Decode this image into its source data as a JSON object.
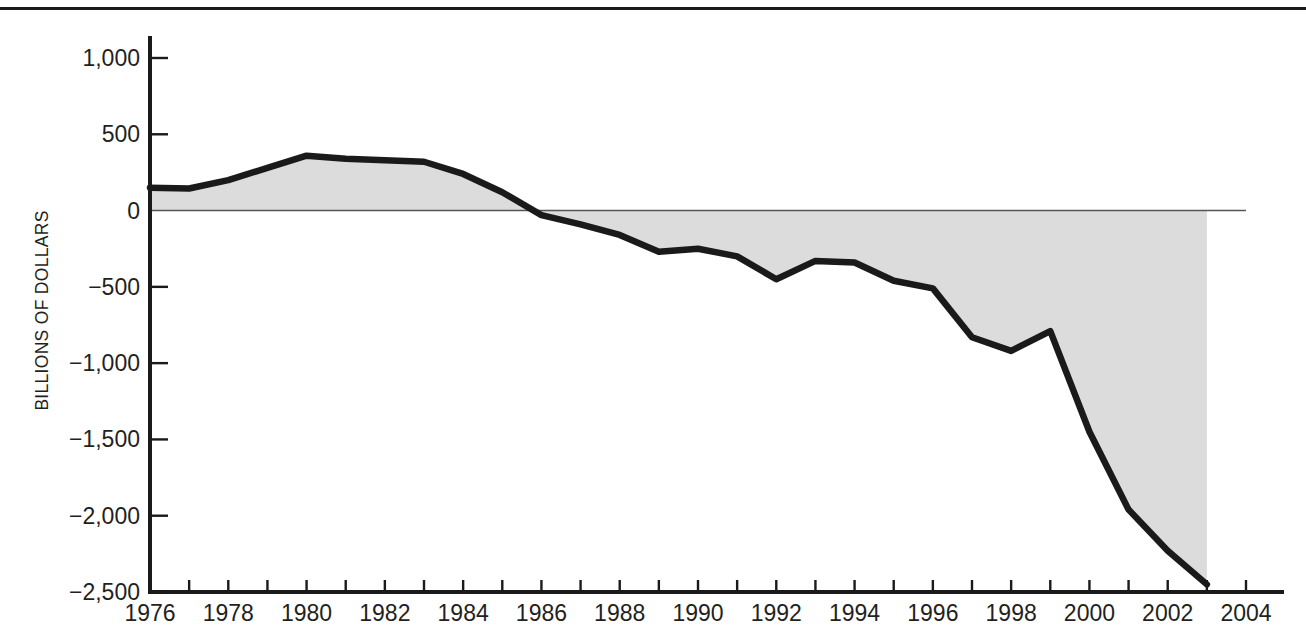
{
  "figure": {
    "background_color": "#ffffff",
    "axis_color": "#1a1a1a",
    "line_color": "#1a1a1a",
    "fill_color": "#dcdcdc",
    "zero_line_color": "#555555",
    "top_rule": true
  },
  "chart_data": {
    "type": "area",
    "title": "",
    "subtitle": "",
    "xlabel": "",
    "ylabel": "BILLIONS OF DOLLARS",
    "xlim": [
      1976,
      2004
    ],
    "ylim": [
      -2500,
      1000
    ],
    "grid": false,
    "legend": null,
    "baseline": 0,
    "y_ticks": [
      1000,
      500,
      0,
      -500,
      -1000,
      -1500,
      -2000,
      -2500
    ],
    "y_tick_labels": [
      "1,000",
      "500",
      "0",
      "−500",
      "−1,000",
      "−1,500",
      "−2,000",
      "−2,500"
    ],
    "x_ticks_major": [
      1976,
      1978,
      1980,
      1982,
      1984,
      1986,
      1988,
      1990,
      1992,
      1994,
      1996,
      1998,
      2000,
      2002,
      2004
    ],
    "x_tick_labels": [
      "1976",
      "1978",
      "1980",
      "1982",
      "1984",
      "1986",
      "1988",
      "1990",
      "1992",
      "1994",
      "1996",
      "1998",
      "2000",
      "2002",
      "2004"
    ],
    "x_ticks_minor": [
      1977,
      1979,
      1981,
      1983,
      1985,
      1987,
      1989,
      1991,
      1993,
      1995,
      1997,
      1999,
      2001,
      2003
    ],
    "x": [
      1976,
      1977,
      1978,
      1979,
      1980,
      1981,
      1982,
      1983,
      1984,
      1985,
      1986,
      1987,
      1988,
      1989,
      1990,
      1991,
      1992,
      1993,
      1994,
      1995,
      1996,
      1997,
      1998,
      1999,
      2000,
      2001,
      2002,
      2003
    ],
    "values": [
      150,
      145,
      200,
      280,
      360,
      340,
      330,
      320,
      240,
      120,
      -30,
      -90,
      -160,
      -270,
      -250,
      -300,
      -450,
      -330,
      -340,
      -460,
      -510,
      -830,
      -920,
      -790,
      -1450,
      -1960,
      -2230,
      -2450
    ],
    "series": [
      {
        "name": "Balance",
        "values": [
          150,
          145,
          200,
          280,
          360,
          340,
          330,
          320,
          240,
          120,
          -30,
          -90,
          -160,
          -270,
          -250,
          -300,
          -450,
          -330,
          -340,
          -460,
          -510,
          -830,
          -920,
          -790,
          -1450,
          -1960,
          -2230,
          -2450
        ]
      }
    ]
  }
}
